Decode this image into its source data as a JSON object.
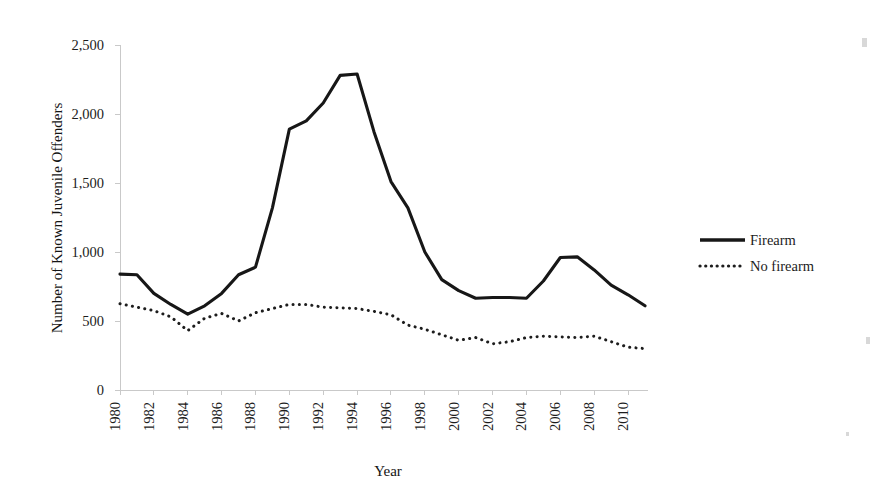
{
  "chart_data": {
    "type": "line",
    "title": "",
    "xlabel": "Year",
    "ylabel": "Number of Known Juvenile Offenders",
    "x": [
      1980,
      1981,
      1982,
      1983,
      1984,
      1985,
      1986,
      1987,
      1988,
      1989,
      1990,
      1991,
      1992,
      1993,
      1994,
      1995,
      1996,
      1997,
      1998,
      1999,
      2000,
      2001,
      2002,
      2003,
      2004,
      2005,
      2006,
      2007,
      2008,
      2009,
      2010,
      2011
    ],
    "x_tick_labels": [
      "1980",
      "1982",
      "1984",
      "1986",
      "1988",
      "1990",
      "1992",
      "1994",
      "1996",
      "1998",
      "2000",
      "2002",
      "2004",
      "2006",
      "2008",
      "2010"
    ],
    "y_tick_labels": [
      "0",
      "500",
      "1,000",
      "1,500",
      "2,000",
      "2,500"
    ],
    "y_tick_values": [
      0,
      500,
      1000,
      1500,
      2000,
      2500
    ],
    "ylim": [
      0,
      2500
    ],
    "xlim": [
      1980,
      2011
    ],
    "grid": false,
    "legend_position": "right",
    "series": [
      {
        "name": "Firearm",
        "style": "solid",
        "color": "#171717",
        "values": [
          840,
          835,
          700,
          620,
          550,
          610,
          700,
          835,
          890,
          1320,
          1890,
          1950,
          2080,
          2280,
          2290,
          1870,
          1510,
          1320,
          1000,
          800,
          720,
          665,
          670,
          670,
          665,
          790,
          960,
          965,
          870,
          760,
          690,
          610
        ]
      },
      {
        "name": "No firearm",
        "style": "dotted",
        "color": "#1d1d1d",
        "values": [
          625,
          600,
          575,
          530,
          430,
          520,
          555,
          500,
          560,
          590,
          620,
          620,
          600,
          595,
          590,
          570,
          545,
          470,
          440,
          400,
          360,
          380,
          335,
          350,
          380,
          390,
          385,
          380,
          390,
          350,
          310,
          300
        ]
      }
    ],
    "legend": [
      {
        "label": "Firearm",
        "style": "solid"
      },
      {
        "label": "No firearm",
        "style": "dotted"
      }
    ]
  },
  "layout": {
    "plot_left": 120,
    "plot_right": 645,
    "plot_top": 45,
    "plot_bottom": 390,
    "legend_x": 700,
    "legend_y_firearm": 240,
    "legend_y_nofirearm": 266
  }
}
